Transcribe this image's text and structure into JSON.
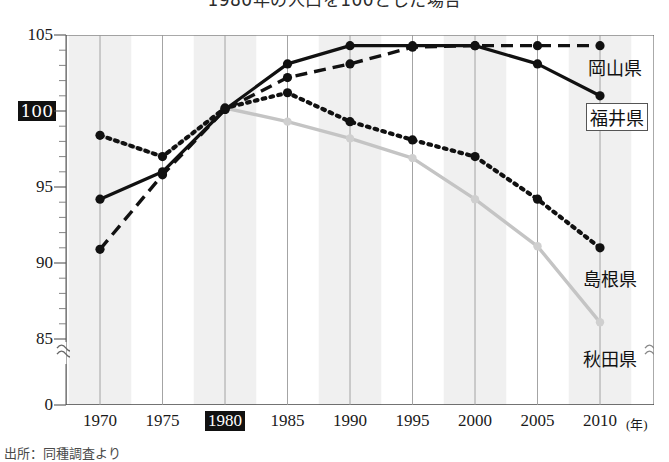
{
  "chart_data": {
    "type": "line",
    "title": "1980年の人口を100とした場合",
    "xlabel": "",
    "ylabel": "",
    "x_unit": "(年)",
    "categories": [
      1970,
      1975,
      1980,
      1985,
      1990,
      1995,
      2000,
      2005,
      2010
    ],
    "xtick_labels": [
      "1970",
      "1975",
      "1980",
      "1985",
      "1990",
      "1995",
      "2000",
      "2005",
      "2010"
    ],
    "highlighted_xtick": "1980",
    "ytick_labels": [
      "105",
      "100",
      "95",
      "90",
      "85",
      "0"
    ],
    "ytick_values": [
      105,
      100,
      95,
      90,
      85,
      0
    ],
    "highlighted_ytick": "100",
    "ylim": [
      84.2,
      105
    ],
    "axis_break": true,
    "axis_break_symbol": "≈",
    "grid": "vertical-banded",
    "legend_position": "inline-right",
    "series": [
      {
        "name": "福井県",
        "style": "solid",
        "color": "#111111",
        "boxed_label": true,
        "values": [
          94.2,
          96.0,
          100.1,
          103.1,
          104.3,
          104.3,
          104.3,
          103.1,
          101.0
        ]
      },
      {
        "name": "岡山県",
        "style": "dashed",
        "color": "#111111",
        "boxed_label": false,
        "values": [
          90.9,
          95.8,
          100.1,
          102.2,
          103.1,
          104.2,
          104.3,
          104.3,
          104.3
        ]
      },
      {
        "name": "島根県",
        "style": "dotted",
        "color": "#111111",
        "boxed_label": false,
        "values": [
          98.4,
          97.0,
          100.2,
          101.2,
          99.3,
          98.1,
          97.0,
          94.2,
          91.0
        ]
      },
      {
        "name": "秋田県",
        "style": "solid-gray",
        "color": "#c4c4c4",
        "boxed_label": false,
        "values": [
          98.4,
          97.0,
          100.2,
          99.3,
          98.2,
          96.9,
          94.2,
          91.1,
          86.1
        ]
      }
    ]
  },
  "source": {
    "note": "出所：同種調査より"
  }
}
